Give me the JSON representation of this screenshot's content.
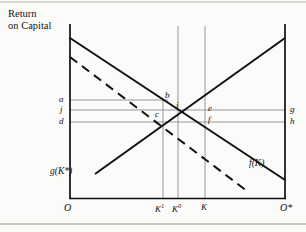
{
  "figure": {
    "title": "Return\non Capital",
    "background": "#fbfbfa",
    "line_color": "#101010",
    "thin_line_color": "#8a8a8a"
  },
  "axes": {
    "left_origin": "O",
    "right_origin": "O*",
    "y_left_labels": [
      "a",
      "j",
      "d"
    ],
    "y_right_labels": [
      "g",
      "h"
    ],
    "x_ticks": [
      {
        "label": "K",
        "sup": "1"
      },
      {
        "label": "K",
        "sup": "0"
      },
      {
        "label": "K",
        "sup": "",
        "hat": true
      }
    ]
  },
  "curves": [
    {
      "name": "f(K)",
      "label": "f(K)",
      "style": "solid",
      "slope": "downward"
    },
    {
      "name": "g(K*)",
      "label": "g(K*)",
      "style": "solid",
      "slope": "upward"
    },
    {
      "name": "shifted",
      "label": "",
      "style": "dashed",
      "slope": "downward"
    }
  ],
  "points": [
    "b",
    "i",
    "c",
    "e",
    "f"
  ],
  "chart_data": {
    "type": "line",
    "title": "Return on Capital",
    "xlabel": "",
    "ylabel": "Return on Capital",
    "series": [
      {
        "name": "f(K)",
        "x": [
          0,
          100
        ],
        "y": [
          100,
          33
        ],
        "style": "solid"
      },
      {
        "name": "g(K*)",
        "x": [
          12,
          100
        ],
        "y": [
          11,
          100
        ],
        "style": "solid"
      },
      {
        "name": "f(K) shifted",
        "x": [
          0,
          82
        ],
        "y": [
          90,
          4
        ],
        "style": "dashed"
      }
    ],
    "vlines": [
      {
        "label": "K1",
        "x": 43
      },
      {
        "label": "K0",
        "x": 50
      },
      {
        "label": "Khat",
        "x": 63
      }
    ],
    "hlines": [
      {
        "label": "a",
        "y": 61
      },
      {
        "label": "j",
        "y": 55
      },
      {
        "label": "d",
        "y": 47
      }
    ],
    "grid": false,
    "legend": "inline-annotation"
  }
}
